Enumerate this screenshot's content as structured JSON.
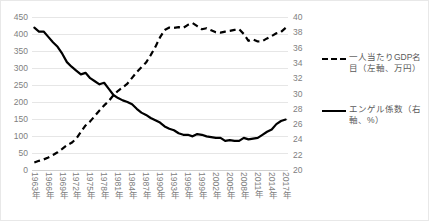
{
  "chart_data": {
    "type": "line",
    "title": "",
    "xlabel": "",
    "grid": true,
    "legend_position": "right",
    "x": [
      "1963年",
      "1964年",
      "1965年",
      "1966年",
      "1967年",
      "1968年",
      "1969年",
      "1970年",
      "1971年",
      "1972年",
      "1973年",
      "1974年",
      "1975年",
      "1976年",
      "1977年",
      "1978年",
      "1979年",
      "1980年",
      "1981年",
      "1982年",
      "1983年",
      "1984年",
      "1985年",
      "1986年",
      "1987年",
      "1988年",
      "1989年",
      "1990年",
      "1991年",
      "1992年",
      "1993年",
      "1994年",
      "1995年",
      "1996年",
      "1997年",
      "1998年",
      "1999年",
      "2000年",
      "2001年",
      "2002年",
      "2003年",
      "2004年",
      "2005年",
      "2006年",
      "2007年",
      "2008年",
      "2009年",
      "2010年",
      "2011年",
      "2012年",
      "2013年",
      "2014年",
      "2015年",
      "2016年",
      "2017年"
    ],
    "x_tick_labels": [
      "1963年",
      "1966年",
      "1969年",
      "1972年",
      "1975年",
      "1978年",
      "1981年",
      "1984年",
      "1987年",
      "1990年",
      "1993年",
      "1996年",
      "1999年",
      "2002年",
      "2005年",
      "2008年",
      "2011年",
      "2014年",
      "2017年"
    ],
    "axes": {
      "left": {
        "label": "一人当たりGDP名目（左軸、万円）",
        "unit": "万円",
        "min": 0,
        "max": 450,
        "step": 50,
        "ticks": [
          450,
          400,
          350,
          300,
          250,
          200,
          150,
          100,
          50,
          0
        ]
      },
      "right": {
        "label": "エンゲル係数（右軸、%）",
        "unit": "%",
        "min": 20,
        "max": 40,
        "step": 2,
        "ticks": [
          40,
          38,
          36,
          34,
          32,
          30,
          28,
          26,
          24,
          22,
          20
        ]
      }
    },
    "series": [
      {
        "name": "一人当たりGDP名目（左軸、万円）",
        "axis": "left",
        "style": "dashed",
        "color": "#000000",
        "values": [
          22,
          27,
          31,
          37,
          44,
          52,
          62,
          73,
          80,
          92,
          112,
          131,
          143,
          159,
          175,
          190,
          203,
          220,
          233,
          243,
          254,
          271,
          288,
          302,
          316,
          338,
          362,
          390,
          412,
          419,
          418,
          420,
          418,
          427,
          432,
          423,
          414,
          417,
          411,
          405,
          404,
          407,
          409,
          412,
          414,
          400,
          380,
          384,
          378,
          379,
          387,
          394,
          402,
          406,
          418
        ]
      },
      {
        "name": "エンゲル係数（右軸、%）",
        "axis": "right",
        "style": "solid",
        "color": "#000000",
        "values": [
          38.6,
          38.1,
          38.1,
          37.4,
          36.7,
          36.1,
          35.2,
          34.1,
          33.5,
          33.0,
          32.5,
          32.7,
          32.0,
          31.6,
          31.2,
          31.4,
          30.6,
          29.8,
          29.4,
          29.1,
          28.9,
          28.6,
          28.0,
          27.5,
          27.2,
          26.8,
          26.5,
          26.2,
          25.7,
          25.4,
          25.2,
          24.8,
          24.6,
          24.6,
          24.4,
          24.7,
          24.6,
          24.4,
          24.3,
          24.2,
          24.2,
          23.8,
          23.9,
          23.8,
          23.8,
          24.2,
          24.0,
          24.1,
          24.2,
          24.6,
          25.0,
          25.3,
          26.0,
          26.4,
          26.6
        ]
      }
    ]
  }
}
